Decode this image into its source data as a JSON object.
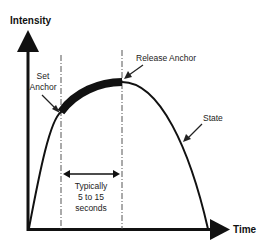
{
  "diagram": {
    "y_axis_label": "Intensity",
    "x_axis_label": "Time",
    "annotations": {
      "set_anchor_line1": "Set",
      "set_anchor_line2": "Anchor",
      "release_anchor": "Release Anchor",
      "state": "State",
      "duration_line1": "Typically",
      "duration_line2": "5 to 15",
      "duration_line3": "seconds"
    },
    "colors": {
      "ink": "#111111",
      "dashed": "#555555",
      "background": "#ffffff"
    }
  }
}
